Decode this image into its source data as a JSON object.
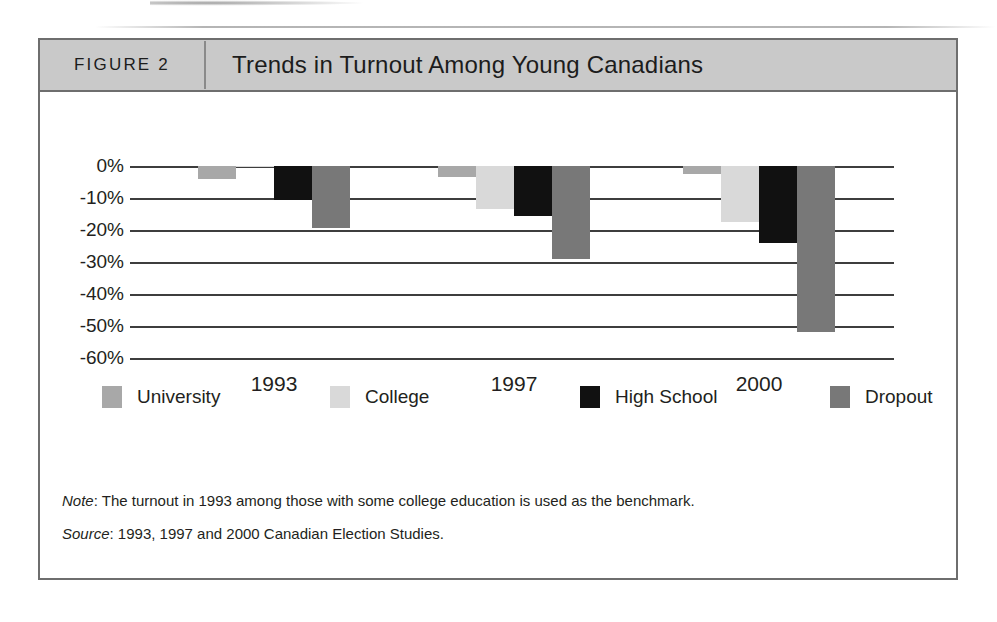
{
  "figure": {
    "number_label": "FIGURE 2",
    "title": "Trends in Turnout Among Young Canadians"
  },
  "notes": {
    "note_prefix": "Note",
    "note_text": ": The turnout in 1993 among those with some college education is used as the benchmark.",
    "source_prefix": "Source",
    "source_text": ": 1993, 1997 and 2000 Canadian Election Studies."
  },
  "colors": {
    "university": "#a8a8a8",
    "college": "#d9d9d9",
    "high_school": "#111111",
    "dropout": "#787878",
    "header_band": "#c9c9c9",
    "frame_border": "#6e6e6e",
    "axis": "#3d3d3d"
  },
  "chart_data": {
    "type": "bar",
    "title": "Trends in Turnout Among Young Canadians",
    "xlabel": "",
    "ylabel": "",
    "categories": [
      "1993",
      "1997",
      "2000"
    ],
    "series": [
      {
        "name": "University",
        "values": [
          -4.0,
          -3.5,
          -2.5
        ]
      },
      {
        "name": "College",
        "values": [
          -0.3,
          -13.5,
          -17.5
        ]
      },
      {
        "name": "High School",
        "values": [
          -10.5,
          -15.5,
          -24.0
        ]
      },
      {
        "name": "Dropout",
        "values": [
          -19.5,
          -29.0,
          -52.0
        ]
      }
    ],
    "ylim": [
      -60,
      0
    ],
    "ytick_labels": [
      "0%",
      "-10%",
      "-20%",
      "-30%",
      "-40%",
      "-50%",
      "-60%"
    ],
    "ytick_values": [
      0,
      -10,
      -20,
      -30,
      -40,
      -50,
      -60
    ],
    "grid": true,
    "legend_position": "bottom"
  }
}
